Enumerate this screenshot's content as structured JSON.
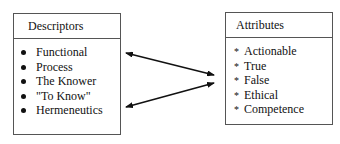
{
  "descriptors": {
    "title": "Descriptors",
    "items": [
      "Functional",
      "Process",
      "The Knower",
      "\"To Know\"",
      "Hermeneutics"
    ]
  },
  "attributes": {
    "title": "Attributes",
    "bullet": "*",
    "items": [
      "Actionable",
      "True",
      "False",
      "Ethical",
      "Competence"
    ]
  },
  "connectors": [
    {
      "from": "Functional",
      "to": "Attributes",
      "type": "double-headed-arrow"
    },
    {
      "from": "Hermeneutics",
      "to": "Attributes",
      "type": "double-headed-arrow"
    }
  ]
}
